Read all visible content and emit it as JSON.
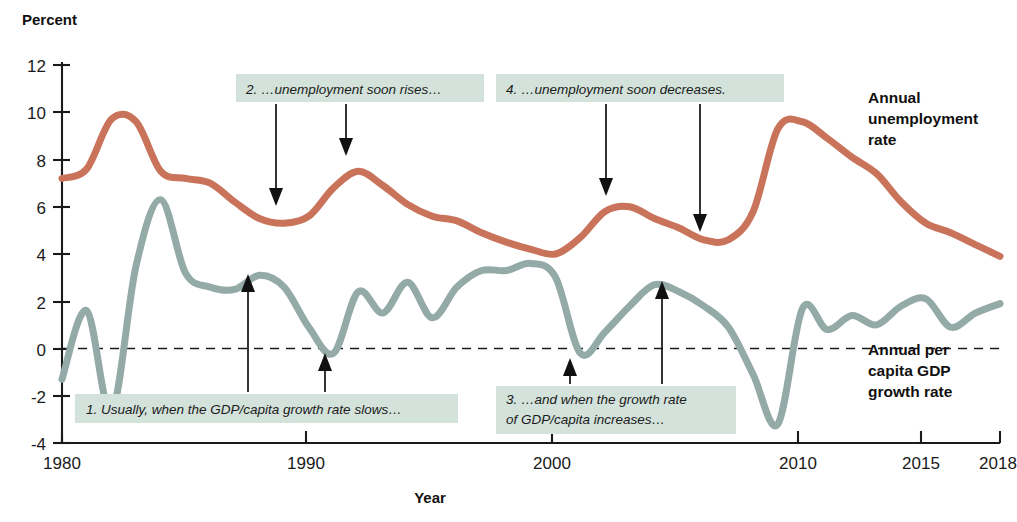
{
  "figure": {
    "y_axis_title": "Percent",
    "x_axis_title": "Year"
  },
  "series_labels": {
    "unemployment": [
      "Annual",
      "unemployment",
      "rate"
    ],
    "gdp": [
      "Annual per",
      "capita GDP",
      "growth rate"
    ]
  },
  "callouts": [
    {
      "id": "callout-1",
      "lines": [
        "1. Usually, when the GDP/capita growth rate slows…"
      ]
    },
    {
      "id": "callout-2",
      "lines": [
        "2. …unemployment soon rises…"
      ]
    },
    {
      "id": "callout-3",
      "lines": [
        "3. …and when the growth rate",
        "of GDP/capita increases…"
      ]
    },
    {
      "id": "callout-4",
      "lines": [
        "4. …unemployment soon decreases."
      ]
    }
  ],
  "colors": {
    "unemployment_line": "#c8735a",
    "gdp_line": "#93aaa7",
    "callout_background": "#d3e2da",
    "axis": "#1a1a1a"
  },
  "chart_data": {
    "type": "line",
    "title": "",
    "xlabel": "Year",
    "ylabel": "Percent",
    "xlim": [
      1980,
      2018
    ],
    "ylim": [
      -4,
      12
    ],
    "grid": false,
    "legend_position": "right-inline-labels",
    "yticks": [
      -4,
      -2,
      0,
      2,
      4,
      6,
      8,
      10,
      12
    ],
    "xticks": [
      1980,
      1990,
      2000,
      2010,
      2015,
      2018
    ],
    "zero_reference_line": 0,
    "x": [
      1980,
      1981,
      1982,
      1983,
      1984,
      1985,
      1986,
      1987,
      1988,
      1989,
      1990,
      1991,
      1992,
      1993,
      1994,
      1995,
      1996,
      1997,
      1998,
      1999,
      2000,
      2001,
      2002,
      2003,
      2004,
      2005,
      2006,
      2007,
      2008,
      2009,
      2010,
      2011,
      2012,
      2013,
      2014,
      2015,
      2016,
      2017,
      2018
    ],
    "series": [
      {
        "name": "Annual unemployment rate",
        "color": "#c8735a",
        "values": [
          7.2,
          7.6,
          9.7,
          9.6,
          7.5,
          7.2,
          7.0,
          6.2,
          5.5,
          5.3,
          5.6,
          6.8,
          7.5,
          6.9,
          6.1,
          5.6,
          5.4,
          4.9,
          4.5,
          4.2,
          4.0,
          4.7,
          5.8,
          6.0,
          5.5,
          5.1,
          4.6,
          4.6,
          5.8,
          9.3,
          9.6,
          8.9,
          8.1,
          7.4,
          6.2,
          5.3,
          4.9,
          4.4,
          3.9
        ]
      },
      {
        "name": "Annual per capita GDP growth rate",
        "color": "#93aaa7",
        "values": [
          -1.3,
          1.6,
          -2.7,
          3.5,
          6.3,
          3.2,
          2.6,
          2.5,
          3.1,
          2.6,
          0.9,
          -0.2,
          2.4,
          1.5,
          2.8,
          1.3,
          2.6,
          3.3,
          3.3,
          3.6,
          3.0,
          -0.2,
          0.7,
          1.8,
          2.7,
          2.4,
          1.8,
          0.9,
          -1.1,
          -3.2,
          1.7,
          0.8,
          1.4,
          1.0,
          1.8,
          2.1,
          0.9,
          1.5,
          1.9
        ]
      }
    ],
    "annotations": [
      {
        "text": "1. Usually, when the GDP/capita growth rate slows…",
        "points_to": [
          1988,
          1991
        ]
      },
      {
        "text": "2. …unemployment soon rises…",
        "points_to": [
          1989,
          1992
        ]
      },
      {
        "text": "3. …and when the growth rate of GDP/capita increases…",
        "points_to": [
          2001,
          2004
        ]
      },
      {
        "text": "4. …unemployment soon decreases.",
        "points_to": [
          2003,
          2007
        ]
      }
    ]
  }
}
